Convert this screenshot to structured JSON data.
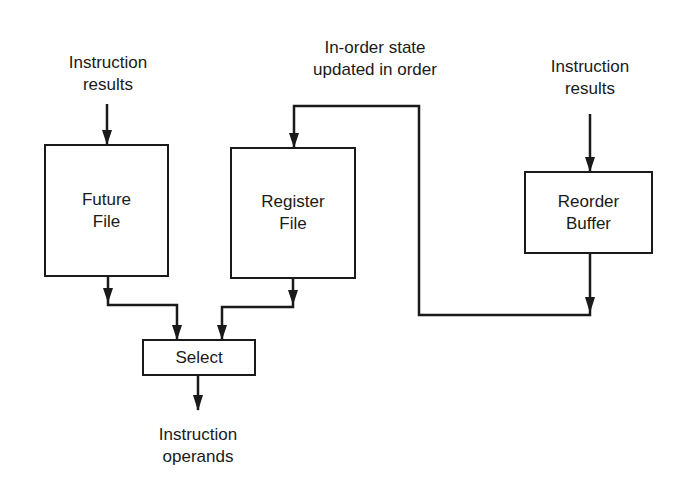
{
  "diagram": {
    "nodes": [
      {
        "id": "future_file",
        "label": "Future\nFile"
      },
      {
        "id": "register_file",
        "label": "Register\nFile"
      },
      {
        "id": "reorder_buffer",
        "label": "Reorder\nBuffer"
      },
      {
        "id": "select",
        "label": "Select"
      }
    ],
    "captions": {
      "future_input": "Instruction\nresults",
      "inorder_state": "In-order state\nupdated in order",
      "reorder_input": "Instruction\nresults",
      "select_output": "Instruction\noperands"
    },
    "edges": [
      {
        "from": "Instruction results",
        "to": "future_file"
      },
      {
        "from": "Instruction results",
        "to": "reorder_buffer"
      },
      {
        "from": "reorder_buffer",
        "to": "register_file",
        "label": "In-order state updated in order"
      },
      {
        "from": "future_file",
        "to": "select"
      },
      {
        "from": "register_file",
        "to": "select"
      },
      {
        "from": "select",
        "to": "Instruction operands"
      }
    ]
  }
}
